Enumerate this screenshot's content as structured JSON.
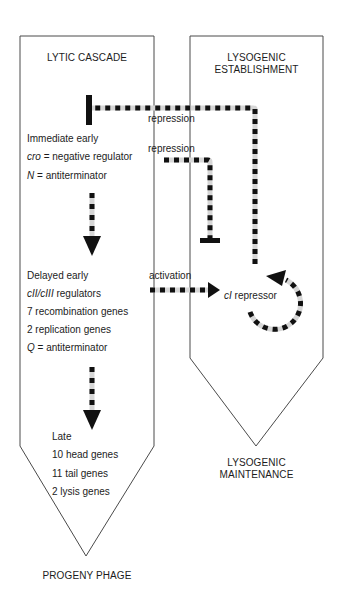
{
  "lytic": {
    "title": "LYTIC CASCADE",
    "immediate_early": {
      "heading": "Immediate early",
      "items": [
        {
          "gene": "cro",
          "rest": " = negative regulator"
        },
        {
          "gene": "N",
          "rest": " = antiterminator"
        }
      ]
    },
    "delayed_early": {
      "heading": "Delayed early",
      "items": [
        {
          "gene": "cII/cIII",
          "rest": " regulators"
        },
        {
          "gene": "",
          "rest": "7 recombination genes"
        },
        {
          "gene": "",
          "rest": "2 replication genes"
        },
        {
          "gene": "Q",
          "rest": " = antiterminator"
        }
      ]
    },
    "late": {
      "heading": "Late",
      "items": [
        "10 head genes",
        "11 tail genes",
        "2 lysis genes"
      ]
    },
    "outcome": "PROGENY PHAGE"
  },
  "lysogenic": {
    "title_line1": "LYSOGENIC",
    "title_line2": "ESTABLISHMENT",
    "repressor": {
      "gene": "cI",
      "rest": " repressor"
    },
    "outcome_line1": "LYSOGENIC",
    "outcome_line2": "MAINTENANCE"
  },
  "connections": [
    {
      "label": "repression",
      "from": "cI repressor",
      "to": "Immediate early",
      "type": "inhibition"
    },
    {
      "label": "repression",
      "from": "cro",
      "to": "cI repressor",
      "type": "inhibition"
    },
    {
      "label": "activation",
      "from": "Delayed early (cII/cIII)",
      "to": "cI repressor",
      "type": "activation"
    }
  ],
  "colors": {
    "line": "#3a3a3a",
    "dash_dark": "#111111",
    "dash_light": "#d8d8d8"
  }
}
